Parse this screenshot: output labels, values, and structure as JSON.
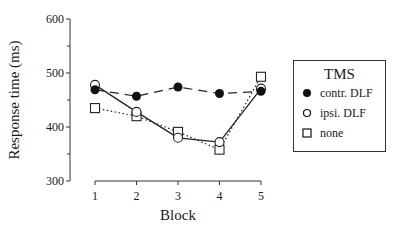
{
  "chart_data": {
    "type": "line",
    "title": "",
    "xlabel": "Block",
    "ylabel": "Response time (ms)",
    "x": [
      1,
      2,
      3,
      4,
      5
    ],
    "categories": [
      "1",
      "2",
      "3",
      "4",
      "5"
    ],
    "ylim": [
      300,
      600
    ],
    "yticks": [
      300,
      400,
      500,
      600
    ],
    "y_minor_step": 50,
    "grid": false,
    "legend_position": "right",
    "legend_title": "TMS",
    "series": [
      {
        "name": "contr. DLF",
        "marker": "filled-circle",
        "line": "dashed",
        "values": [
          469,
          457,
          474,
          462,
          466
        ]
      },
      {
        "name": "ipsi. DLF",
        "marker": "open-circle",
        "line": "solid",
        "values": [
          478,
          428,
          380,
          372,
          471
        ]
      },
      {
        "name": "none",
        "marker": "open-square",
        "line": "dotted",
        "values": [
          435,
          420,
          391,
          358,
          493
        ]
      }
    ]
  },
  "axes": {
    "y_tick_labels": [
      "600",
      "500",
      "400",
      "300"
    ],
    "x_tick_labels": [
      "1",
      "2",
      "3",
      "4",
      "5"
    ],
    "x_title": "Block",
    "y_title": "Response time (ms)"
  },
  "legend": {
    "title": "TMS",
    "items": [
      {
        "label": "contr. DLF"
      },
      {
        "label": "ipsi. DLF"
      },
      {
        "label": "none"
      }
    ]
  }
}
